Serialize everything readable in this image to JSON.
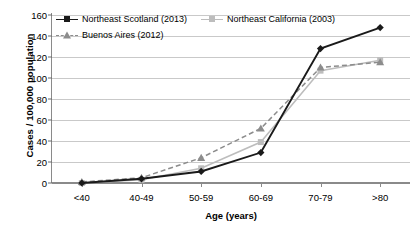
{
  "chart_data": {
    "type": "line",
    "title": "",
    "xlabel": "Age (years)",
    "ylabel": "Cases / 100,000 population",
    "categories": [
      "<40",
      "40-49",
      "50-59",
      "60-69",
      "70-79",
      ">80"
    ],
    "ylim": [
      0,
      160
    ],
    "ytick_step": 20,
    "yticks": [
      0,
      20,
      40,
      60,
      80,
      100,
      120,
      140,
      160
    ],
    "grid": true,
    "legend_position": "top-left",
    "series": [
      {
        "name": "Northeast Scotland (2013)",
        "values": [
          0,
          4,
          11,
          29,
          128,
          148
        ],
        "color": "#1a1a1a",
        "marker": "diamond",
        "line_style": "solid"
      },
      {
        "name": "Northeast California (2003)",
        "values": [
          0,
          3,
          14,
          39,
          107,
          117
        ],
        "color": "#bdbdbd",
        "marker": "square",
        "line_style": "solid"
      },
      {
        "name": "Buenos Aires (2012)",
        "values": [
          1,
          5,
          24,
          52,
          110,
          115
        ],
        "color": "#8c8c8c",
        "marker": "triangle",
        "line_style": "dashed"
      }
    ]
  }
}
